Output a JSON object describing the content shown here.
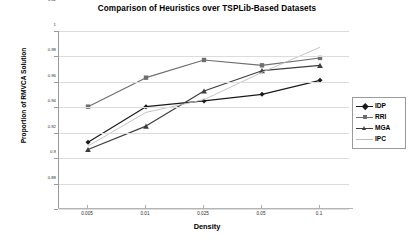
{
  "chart_data": {
    "type": "line",
    "title": "Comparison of Heuristics over TSPLib-Based Datasets",
    "xlabel": "Density",
    "ylabel": "Proportion of RMVCA Solution",
    "categories": [
      "0.005",
      "0.01",
      "0.025",
      "0.05",
      "0.1"
    ],
    "ylim": [
      0.88,
      1.02
    ],
    "yticks": [
      "0.88",
      "0.9",
      "0.92",
      "0.94",
      "0.96",
      "0.98",
      "1",
      "1.02"
    ],
    "ytick_values": [
      0.88,
      0.9,
      0.92,
      0.94,
      0.96,
      0.98,
      1.0,
      1.02
    ],
    "grid": true,
    "legend_position": "right",
    "series": [
      {
        "name": "IDP",
        "marker": "diamond",
        "color": "#1a1a1a",
        "values": [
          0.9325,
          0.9605,
          0.965,
          0.9702,
          0.9812
        ]
      },
      {
        "name": "RRI",
        "marker": "square",
        "color": "#6e6e6e",
        "values": [
          0.9605,
          0.9833,
          0.9972,
          0.993,
          0.9988
        ]
      },
      {
        "name": "MGA",
        "marker": "triangle",
        "color": "#3d3d3d",
        "values": [
          0.9268,
          0.9452,
          0.9728,
          0.9888,
          0.993
        ]
      },
      {
        "name": "IPC",
        "marker": "none",
        "color": "#bdbdbd",
        "values": [
          0.9295,
          0.956,
          0.966,
          0.9875,
          1.0072
        ]
      }
    ]
  },
  "legend": {
    "items": [
      {
        "label": "IDP"
      },
      {
        "label": "RRI"
      },
      {
        "label": "MGA"
      },
      {
        "label": "IPC"
      }
    ]
  }
}
